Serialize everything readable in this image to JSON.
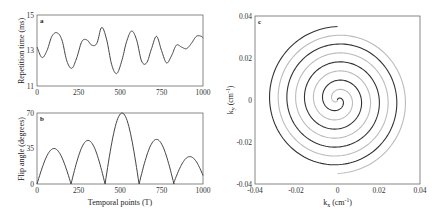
{
  "chart_data": [
    {
      "panel": "a",
      "type": "line",
      "xlabel": "",
      "ylabel": "Repetition time (ms)",
      "xlim": [
        0,
        1000
      ],
      "ylim": [
        11,
        15
      ],
      "xticks": [
        "0",
        "250",
        "500",
        "750",
        "1000"
      ],
      "yticks": [
        "11",
        "13",
        "15"
      ],
      "grid": false,
      "x": [
        0,
        30,
        60,
        90,
        120,
        150,
        180,
        210,
        240,
        270,
        300,
        330,
        360,
        390,
        420,
        450,
        480,
        510,
        540,
        570,
        600,
        630,
        660,
        690,
        720,
        750,
        780,
        810,
        840,
        870,
        900,
        930,
        960,
        990,
        1000
      ],
      "values": [
        13.2,
        12.6,
        13.0,
        13.8,
        14.0,
        13.6,
        12.4,
        12.0,
        12.6,
        13.5,
        13.6,
        13.3,
        13.4,
        14.3,
        13.6,
        12.2,
        11.7,
        12.4,
        13.5,
        14.1,
        13.6,
        12.4,
        12.3,
        13.1,
        13.8,
        13.0,
        12.3,
        12.7,
        13.3,
        13.2,
        13.1,
        13.4,
        13.8,
        13.8,
        13.7
      ]
    },
    {
      "panel": "b",
      "type": "line",
      "xlabel": "Temporal points (T)",
      "ylabel": "Flip angle (degrees)",
      "xlim": [
        0,
        1000
      ],
      "ylim": [
        0,
        70
      ],
      "xticks": [
        "0",
        "250",
        "500",
        "750",
        "1000"
      ],
      "yticks": [
        "0",
        "35",
        "70"
      ],
      "grid": false,
      "arches": [
        {
          "start": 0,
          "end": 205,
          "peak": 35
        },
        {
          "start": 205,
          "end": 410,
          "peak": 43
        },
        {
          "start": 410,
          "end": 615,
          "peak": 70
        },
        {
          "start": 615,
          "end": 825,
          "peak": 44
        },
        {
          "start": 825,
          "end": 1000,
          "peak": 27
        }
      ]
    },
    {
      "panel": "c",
      "type": "line",
      "xlabel": "k_x (cm^-1)",
      "ylabel": "k_y (cm^-1)",
      "xlim": [
        -0.04,
        0.04
      ],
      "ylim": [
        -0.04,
        0.04
      ],
      "xticks": [
        "-0.04",
        "-0.02",
        "0",
        "0.02",
        "0.04"
      ],
      "yticks": [
        "-0.04",
        "-0.02",
        "0",
        "0.02",
        "0.04"
      ],
      "grid": false,
      "series": [
        {
          "name": "spiral-arm-dark",
          "color": "#333333",
          "turns": 4,
          "max_radius": 0.035,
          "phase_deg": 0
        },
        {
          "name": "spiral-arm-light",
          "color": "#bbbbbb",
          "turns": 4,
          "max_radius": 0.035,
          "phase_deg": 180
        }
      ]
    }
  ],
  "labels": {
    "a": {
      "panel": "a",
      "ylabel": "Repetition time (ms)",
      "yticks": [
        "15",
        "13",
        "11"
      ],
      "xticks": [
        "0",
        "250",
        "500",
        "750",
        "1000"
      ]
    },
    "b": {
      "panel": "b",
      "ylabel": "Flip angle (degrees)",
      "xlabel": "Temporal points (T)",
      "yticks": [
        "70",
        "35",
        "0"
      ],
      "xticks": [
        "0",
        "250",
        "500",
        "750",
        "1000"
      ]
    },
    "c": {
      "panel": "c",
      "ylabel_main": "k",
      "ylabel_sub": "y",
      "ylabel_unit": " (cm",
      "xlabel_main": "k",
      "xlabel_sub": "x",
      "unit_close": ")",
      "unit_exp": "-1",
      "yticks": [
        "0.04",
        "0.02",
        "0",
        "-0.02",
        "-0.04"
      ],
      "xticks": [
        "-0.04",
        "-0.02",
        "0",
        "0.02",
        "0.04"
      ]
    }
  }
}
